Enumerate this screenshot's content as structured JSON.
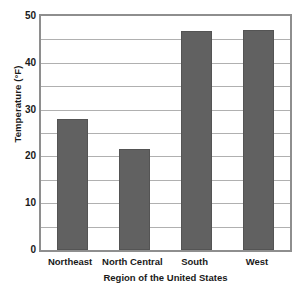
{
  "chart_data": {
    "type": "bar",
    "title": "",
    "categories": [
      "Northeast",
      "North Central",
      "South",
      "West"
    ],
    "values": [
      28,
      21.5,
      46.8,
      47
    ],
    "xlabel": "Region of the United States",
    "ylabel": "Temperature (°F)",
    "ylim": [
      0,
      50
    ],
    "ytick_labels": [
      "0",
      "10",
      "20",
      "30",
      "40",
      "50"
    ],
    "ytick_values": [
      0,
      10,
      20,
      30,
      40,
      50
    ],
    "minor_gridline_values": [
      5,
      10,
      15,
      20,
      25,
      30,
      35,
      40,
      45
    ],
    "grid": true,
    "legend": "none",
    "bar_color": "#616161",
    "grid_color": "#b0b0b0",
    "axis_color": "#8e8e8e",
    "text_color": "#1a1a1a"
  },
  "artifacts": {
    "top_crop_sliver": ""
  }
}
